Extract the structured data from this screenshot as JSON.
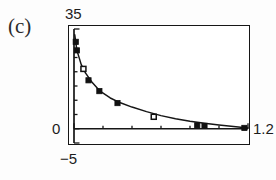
{
  "panel": {
    "label": "(c)"
  },
  "axes": {
    "y_max_label": "35",
    "y_zero_label": "0",
    "y_min_label": "−5",
    "x_max_label": "1.2"
  },
  "chart_data": {
    "type": "scatter",
    "title": "(c)",
    "xlabel": "",
    "ylabel": "",
    "xlim": [
      0,
      1.2
    ],
    "ylim": [
      -5,
      35
    ],
    "grid": false,
    "legend": "none",
    "axis_ticks": {
      "x_major_labels": [
        "0",
        "1.2"
      ],
      "x_tick_values": [
        0.0,
        0.2,
        0.4,
        0.6,
        0.8,
        1.0,
        1.2
      ],
      "y_major_labels": [
        "−5",
        "0",
        "35"
      ],
      "y_tick_values": [
        -5,
        0,
        5,
        10,
        15,
        20,
        25,
        30,
        35
      ]
    },
    "series": [
      {
        "name": "filled-squares",
        "marker": "filled-square",
        "x": [
          0.012,
          0.02,
          0.1,
          0.175,
          0.3,
          0.85,
          0.9,
          1.175
        ],
        "y": [
          30.5,
          27.5,
          17.0,
          13.2,
          9.0,
          1.2,
          1.0,
          0.3
        ]
      },
      {
        "name": "open-squares",
        "marker": "open-square",
        "x": [
          0.065,
          0.55
        ],
        "y": [
          21.0,
          4.2
        ]
      },
      {
        "name": "fitted-curve",
        "marker": "none",
        "line": "solid",
        "x": [
          0.005,
          0.02,
          0.05,
          0.08,
          0.12,
          0.18,
          0.25,
          0.32,
          0.4,
          0.5,
          0.6,
          0.7,
          0.8,
          0.9,
          1.0,
          1.1,
          1.2
        ],
        "y": [
          33.0,
          27.5,
          22.5,
          19.5,
          16.6,
          13.2,
          10.8,
          9.1,
          7.6,
          6.0,
          4.6,
          3.5,
          2.6,
          1.9,
          1.3,
          0.8,
          0.3
        ]
      }
    ]
  }
}
